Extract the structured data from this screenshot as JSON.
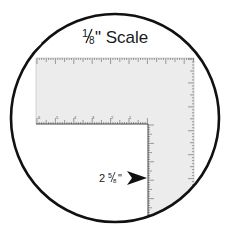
{
  "diagram": {
    "title": {
      "numerator": "1",
      "denominator": "8",
      "suffix": "\" Scale"
    },
    "measurement_label": {
      "whole": "2 ",
      "numerator": "5",
      "denominator": "8",
      "suffix": "\""
    },
    "bottom_scale_numbers": [
      "6",
      "5",
      "4",
      "3",
      "2",
      "1"
    ],
    "colors": {
      "ruler_fill": "#ececec",
      "outline": "#111111",
      "tick": "#444444"
    }
  }
}
